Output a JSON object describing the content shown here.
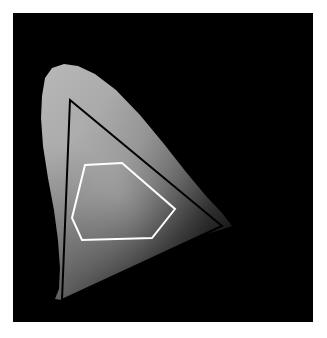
{
  "figure": {
    "canvas_width": 327,
    "canvas_height": 338,
    "page_background": "#ffffff"
  },
  "chart_data": {
    "type": "scatter",
    "subtitle": "",
    "xlabel": "",
    "ylabel": "",
    "xlim": [
      0,
      0.8
    ],
    "ylim": [
      0,
      0.9
    ],
    "grid": false,
    "legend_position": "none",
    "tick_labels_x": [],
    "tick_labels_y": [],
    "annotations": [],
    "plot_area": {
      "background_color": "#000000",
      "left": 13,
      "top": 13,
      "width": 300,
      "height": 309
    },
    "series": [
      {
        "name": "spectral-locus-region",
        "kind": "filled-region",
        "fill_style": "grayscale-gradient",
        "fill_colors": [
          "#b3b3b3",
          "#9a9a9a",
          "#6e6e6e",
          "#2b2b2b",
          "#101010"
        ],
        "stroke": "none",
        "points": [
          [
            45,
            78
          ],
          [
            42,
            96
          ],
          [
            41,
            118
          ],
          [
            43,
            146
          ],
          [
            48,
            178
          ],
          [
            54,
            210
          ],
          [
            58,
            240
          ],
          [
            60,
            268
          ],
          [
            59,
            289
          ],
          [
            55,
            299
          ],
          [
            62,
            300
          ],
          [
            96,
            285
          ],
          [
            132,
            268
          ],
          [
            168,
            250
          ],
          [
            200,
            236
          ],
          [
            226,
            228
          ],
          [
            232,
            226
          ],
          [
            222,
            213
          ],
          [
            206,
            196
          ],
          [
            186,
            172
          ],
          [
            164,
            144
          ],
          [
            140,
            115
          ],
          [
            116,
            90
          ],
          [
            95,
            74
          ],
          [
            78,
            66
          ],
          [
            64,
            64
          ],
          [
            52,
            68
          ]
        ]
      },
      {
        "name": "gamut-triangle",
        "kind": "polygon-outline",
        "stroke": "#000000",
        "stroke_width": 2,
        "fill": "none",
        "vertices": [
          [
            70,
            100
          ],
          [
            222,
            226
          ],
          [
            62,
            300
          ]
        ],
        "vertex_labels": [
          "green-primary",
          "red-primary",
          "blue-primary"
        ]
      },
      {
        "name": "object-gamut-polygon",
        "kind": "polygon-outline",
        "stroke": "#ffffff",
        "stroke_width": 2,
        "fill": "none",
        "vertices": [
          [
            85,
            165
          ],
          [
            122,
            163
          ],
          [
            175,
            209
          ],
          [
            152,
            238
          ],
          [
            82,
            240
          ],
          [
            72,
            218
          ]
        ],
        "vertex_labels": [
          "v1",
          "v2",
          "v3",
          "v4",
          "v5",
          "v6"
        ]
      }
    ],
    "colors": {
      "background": "#000000",
      "triangle_stroke": "#000000",
      "polygon_stroke": "#ffffff",
      "locus_light": "#b3b3b3",
      "locus_dark": "#101010",
      "page": "#ffffff"
    }
  }
}
